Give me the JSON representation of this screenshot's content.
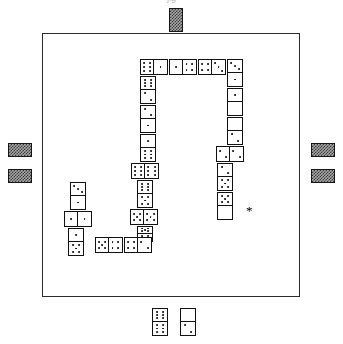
{
  "caption": "jig",
  "board": {
    "x": 42,
    "y": 33,
    "width": 258,
    "height": 264,
    "border_color": "#2b2b2b",
    "background": "#ffffff"
  },
  "colors": {
    "line": "#111111",
    "board_border": "#2b2b2b",
    "marker_dark": "#3a3a3a",
    "marker_light": "#a8a8a8",
    "pip": "#000000",
    "paper": "#ffffff"
  },
  "legend": {
    "marker_name": "train-marker",
    "asterisk_symbol": "*"
  },
  "markers": [
    {
      "name": "train-marker-top",
      "x": 169,
      "y": 8,
      "w": 14,
      "h": 24,
      "orientation": "vertical"
    },
    {
      "name": "train-marker-left-upper",
      "x": 8,
      "y": 143,
      "w": 24,
      "h": 14,
      "orientation": "horizontal"
    },
    {
      "name": "train-marker-left-lower",
      "x": 8,
      "y": 169,
      "w": 24,
      "h": 14,
      "orientation": "horizontal"
    },
    {
      "name": "train-marker-right-upper",
      "x": 311,
      "y": 143,
      "w": 24,
      "h": 14,
      "orientation": "horizontal"
    },
    {
      "name": "train-marker-right-lower",
      "x": 311,
      "y": 169,
      "w": 24,
      "h": 14,
      "orientation": "horizontal"
    }
  ],
  "asterisk": {
    "x": 246,
    "y": 204,
    "symbol": "*"
  },
  "dominoes": [
    {
      "name": "domino-top-1",
      "x": 140,
      "y": 59,
      "w": 28,
      "h": 16,
      "orientation": "h",
      "a": 6,
      "b": 1
    },
    {
      "name": "domino-top-2",
      "x": 169,
      "y": 59,
      "w": 28,
      "h": 16,
      "orientation": "h",
      "a": 1,
      "b": 4
    },
    {
      "name": "domino-top-3",
      "x": 198,
      "y": 59,
      "w": 28,
      "h": 16,
      "orientation": "h",
      "a": 4,
      "b": 3
    },
    {
      "name": "domino-top-4",
      "x": 227,
      "y": 59,
      "w": 16,
      "h": 28,
      "orientation": "v",
      "a": 3,
      "b": 1
    },
    {
      "name": "domino-right-1",
      "x": 227,
      "y": 88,
      "w": 16,
      "h": 28,
      "orientation": "v",
      "a": 1,
      "b": 0
    },
    {
      "name": "domino-right-2",
      "x": 227,
      "y": 117,
      "w": 16,
      "h": 28,
      "orientation": "v",
      "a": 0,
      "b": 2
    },
    {
      "name": "domino-right-3",
      "x": 216,
      "y": 146,
      "w": 28,
      "h": 16,
      "orientation": "h",
      "a": 2,
      "b": 2
    },
    {
      "name": "domino-right-4",
      "x": 217,
      "y": 163,
      "w": 16,
      "h": 28,
      "orientation": "v",
      "a": 2,
      "b": 5
    },
    {
      "name": "domino-right-5",
      "x": 217,
      "y": 192,
      "w": 16,
      "h": 28,
      "orientation": "v",
      "a": 5,
      "b": 0
    },
    {
      "name": "domino-left-1",
      "x": 140,
      "y": 76,
      "w": 16,
      "h": 28,
      "orientation": "v",
      "a": 6,
      "b": 2
    },
    {
      "name": "domino-left-2",
      "x": 140,
      "y": 105,
      "w": 16,
      "h": 28,
      "orientation": "v",
      "a": 2,
      "b": 1
    },
    {
      "name": "domino-left-3",
      "x": 140,
      "y": 134,
      "w": 16,
      "h": 28,
      "orientation": "v",
      "a": 1,
      "b": 6
    },
    {
      "name": "domino-left-4",
      "x": 131,
      "y": 163,
      "w": 28,
      "h": 16,
      "orientation": "h",
      "a": 6,
      "b": 6
    },
    {
      "name": "domino-left-5",
      "x": 137,
      "y": 180,
      "w": 16,
      "h": 28,
      "orientation": "v",
      "a": 6,
      "b": 5
    },
    {
      "name": "domino-left-6",
      "x": 130,
      "y": 209,
      "w": 28,
      "h": 16,
      "orientation": "h",
      "a": 5,
      "b": 5
    },
    {
      "name": "domino-left-7",
      "x": 137,
      "y": 226,
      "w": 16,
      "h": 16,
      "orientation": "v",
      "a": 5,
      "b": 5
    },
    {
      "name": "domino-bottom-1",
      "x": 95,
      "y": 237,
      "w": 28,
      "h": 16,
      "orientation": "h",
      "a": 5,
      "b": 4
    },
    {
      "name": "domino-bottom-2",
      "x": 124,
      "y": 237,
      "w": 28,
      "h": 16,
      "orientation": "h",
      "a": 4,
      "b": 2
    },
    {
      "name": "domino-lower-left-1",
      "x": 68,
      "y": 228,
      "w": 16,
      "h": 28,
      "orientation": "v",
      "a": 1,
      "b": 5
    },
    {
      "name": "domino-lower-left-2",
      "x": 64,
      "y": 211,
      "w": 28,
      "h": 16,
      "orientation": "h",
      "a": 1,
      "b": 1
    },
    {
      "name": "domino-lower-left-3",
      "x": 70,
      "y": 182,
      "w": 16,
      "h": 28,
      "orientation": "v",
      "a": 3,
      "b": 1
    },
    {
      "name": "domino-outside-1",
      "x": 152,
      "y": 308,
      "w": 16,
      "h": 28,
      "orientation": "v",
      "a": 6,
      "b": 6
    },
    {
      "name": "domino-outside-2",
      "x": 180,
      "y": 308,
      "w": 16,
      "h": 28,
      "orientation": "v",
      "a": 0,
      "b": 2
    }
  ]
}
